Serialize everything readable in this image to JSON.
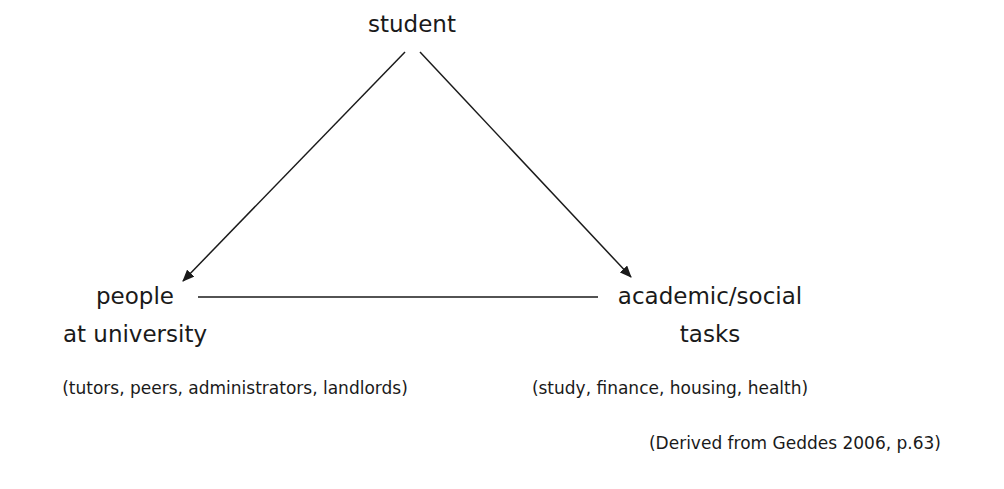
{
  "diagram": {
    "nodes": {
      "top": {
        "label": "student"
      },
      "left": {
        "line1": "people",
        "line2": "at university",
        "detail": "(tutors, peers, administrators, landlords)"
      },
      "right": {
        "line1": "academic/social",
        "line2": "tasks",
        "detail": "(study, finance, housing, health)"
      }
    },
    "edges": [
      {
        "from": "student",
        "to": "people at university",
        "arrow": true
      },
      {
        "from": "student",
        "to": "academic/social tasks",
        "arrow": true
      },
      {
        "from": "people at university",
        "to": "academic/social tasks",
        "arrow": false
      }
    ],
    "citation": "(Derived from Geddes 2006, p.63)",
    "colors": {
      "ink": "#1a1a1a",
      "background": "#ffffff"
    }
  }
}
